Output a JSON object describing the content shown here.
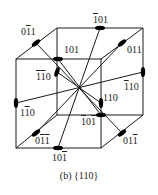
{
  "figure": {
    "caption": "(b) {110}",
    "type": "cube with {110} twofold rotation axes",
    "line_color": "#1a1a1a",
    "axis_marker_color": "#000000",
    "labels": [
      {
        "id": "0-1bar-1",
        "parts": [
          {
            "t": "0"
          },
          {
            "t": "1",
            "bar": true
          },
          {
            "t": "1"
          }
        ],
        "x": 21,
        "y": 27
      },
      {
        "id": "-1bar01",
        "parts": [
          {
            "t": "1",
            "bar": true
          },
          {
            "t": "0"
          },
          {
            "t": "1"
          }
        ],
        "x": 93,
        "y": 15
      },
      {
        "id": "101",
        "parts": [
          {
            "t": "101"
          }
        ],
        "x": 64,
        "y": 45
      },
      {
        "id": "011",
        "parts": [
          {
            "t": "011"
          }
        ],
        "x": 127,
        "y": 45
      },
      {
        "id": "-1-10",
        "parts": [
          {
            "t": "1",
            "bar": true
          },
          {
            "t": "1",
            "bar": true
          },
          {
            "t": "0"
          }
        ],
        "x": 36,
        "y": 72
      },
      {
        "id": "-110",
        "parts": [
          {
            "t": "1",
            "bar": true
          },
          {
            "t": "1"
          },
          {
            "t": "0"
          }
        ],
        "x": 124,
        "y": 82
      },
      {
        "id": "1-10",
        "parts": [
          {
            "t": "1"
          },
          {
            "t": "1",
            "bar": true
          },
          {
            "t": "0"
          }
        ],
        "x": 20,
        "y": 108
      },
      {
        "id": "110",
        "parts": [
          {
            "t": "110"
          }
        ],
        "x": 103,
        "y": 93
      },
      {
        "id": "-10-1",
        "parts": [
          {
            "t": "1",
            "bar": true
          },
          {
            "t": "0"
          },
          {
            "t": "1",
            "bar": true
          }
        ],
        "x": 81,
        "y": 117
      },
      {
        "id": "0-1-1",
        "parts": [
          {
            "t": "0"
          },
          {
            "t": "1",
            "bar": true
          },
          {
            "t": "1",
            "bar": true
          }
        ],
        "x": 35,
        "y": 136
      },
      {
        "id": "01-1",
        "parts": [
          {
            "t": "0"
          },
          {
            "t": "1"
          },
          {
            "t": "1",
            "bar": true
          }
        ],
        "x": 123,
        "y": 136
      },
      {
        "id": "10-1",
        "parts": [
          {
            "t": "1"
          },
          {
            "t": "0"
          },
          {
            "t": "1",
            "bar": true
          }
        ],
        "x": 52,
        "y": 153
      }
    ]
  }
}
